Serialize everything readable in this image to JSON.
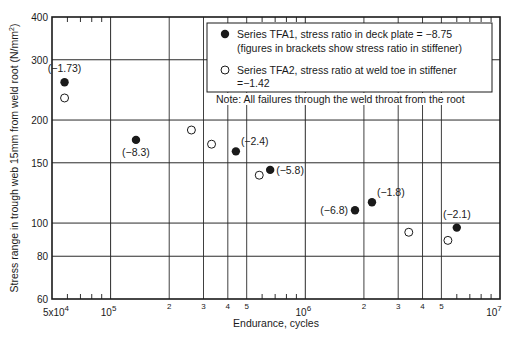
{
  "chart_data": {
    "type": "scatter",
    "title": "",
    "xlabel": "Endurance, cycles",
    "ylabel": "Stress range in trough web 15mm from weld root (N/mm²)",
    "xscale": "log",
    "yscale": "log",
    "xlim": [
      50000,
      10000000
    ],
    "ylim": [
      60,
      400
    ],
    "grid": true,
    "x_major_ticks": [
      {
        "value": 50000,
        "label": "5x10",
        "sup": "4"
      },
      {
        "value": 100000,
        "label": "10",
        "sup": "5"
      },
      {
        "value": 1000000,
        "label": "10",
        "sup": "6"
      },
      {
        "value": 10000000,
        "label": "10",
        "sup": "7"
      }
    ],
    "x_minor_labeled_ticks": [
      {
        "value": 200000,
        "label": "2"
      },
      {
        "value": 300000,
        "label": "3"
      },
      {
        "value": 400000,
        "label": "4"
      },
      {
        "value": 500000,
        "label": "5"
      },
      {
        "value": 2000000,
        "label": "2"
      },
      {
        "value": 3000000,
        "label": "3"
      },
      {
        "value": 4000000,
        "label": "4"
      },
      {
        "value": 5000000,
        "label": "5"
      }
    ],
    "x_small_ticks": [
      60000,
      70000,
      80000,
      90000,
      600000,
      700000,
      800000,
      900000,
      6000000,
      7000000,
      8000000,
      9000000
    ],
    "y_ticks": [
      {
        "value": 400,
        "label": "400"
      },
      {
        "value": 300,
        "label": "300"
      },
      {
        "value": 200,
        "label": "200"
      },
      {
        "value": 150,
        "label": "150"
      },
      {
        "value": 100,
        "label": "100"
      },
      {
        "value": 80,
        "label": "80"
      },
      {
        "value": 60,
        "label": "60"
      }
    ],
    "series": [
      {
        "name": "Series TFA1, stress ratio in deck plate = −8.75",
        "name_line2": "(figures in brackets show stress ratio in stiffener)",
        "marker": "filled-circle",
        "points": [
          {
            "x": 58000,
            "y": 258,
            "label": "(−1.73)",
            "label_pos": "above"
          },
          {
            "x": 135000,
            "y": 175,
            "label": "(−8.3)",
            "label_pos": "below"
          },
          {
            "x": 440000,
            "y": 162,
            "label": "(−2.4)",
            "label_pos": "above-right"
          },
          {
            "x": 660000,
            "y": 143,
            "label": "(−5.8)",
            "label_pos": "right"
          },
          {
            "x": 1800000,
            "y": 109,
            "label": "(−6.8)",
            "label_pos": "left"
          },
          {
            "x": 2200000,
            "y": 115,
            "label": "(−1.8)",
            "label_pos": "above-right"
          },
          {
            "x": 6000000,
            "y": 97,
            "label": "(−2.1)",
            "label_pos": "above"
          }
        ]
      },
      {
        "name": "Series TFA2, stress ratio at weld toe in stiffener",
        "name_line2": "=−1.42",
        "marker": "open-circle",
        "points": [
          {
            "x": 58000,
            "y": 232
          },
          {
            "x": 260000,
            "y": 187
          },
          {
            "x": 330000,
            "y": 170
          },
          {
            "x": 580000,
            "y": 138
          },
          {
            "x": 3400000,
            "y": 94
          },
          {
            "x": 5400000,
            "y": 89
          }
        ]
      }
    ],
    "annotation": "Note: All failures through the weld throat from the root",
    "legend_position": "top-right"
  },
  "colors": {
    "ink": "#1a1a1a",
    "grid": "#2a2a2a",
    "background": "#ffffff"
  }
}
